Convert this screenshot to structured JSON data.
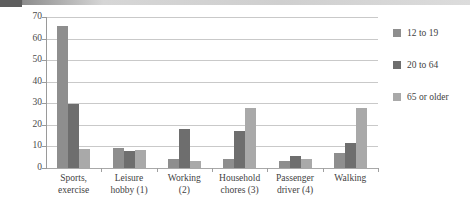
{
  "chart_data": {
    "type": "bar",
    "title": "",
    "subtitle": "",
    "xlabel": "",
    "ylabel": "",
    "ylim": [
      0,
      70
    ],
    "yticks": [
      0,
      10,
      20,
      30,
      40,
      50,
      60,
      70
    ],
    "ytick_labels": [
      "0",
      "10",
      "20",
      "30",
      "40",
      "50",
      "60",
      "70"
    ],
    "grid": true,
    "legend_position": "right",
    "orientation": "vertical",
    "grouped": true,
    "categories": [
      "Sports, exercise",
      "Leisure hobby (1)",
      "Working (2)",
      "Household chores (3)",
      "Passenger driver (4)",
      "Walking"
    ],
    "category_lines": [
      [
        "Sports,",
        "exercise"
      ],
      [
        "Leisure",
        "hobby (1)"
      ],
      [
        "Working",
        "(2)"
      ],
      [
        "Household",
        "chores (3)"
      ],
      [
        "Passenger",
        "driver (4)"
      ],
      [
        "Walking",
        ""
      ]
    ],
    "series": [
      {
        "name": "12 to 19",
        "color": "#8e8e8e",
        "values": [
          66,
          9.1,
          4.0,
          4.0,
          3.4,
          7.0
        ]
      },
      {
        "name": "20 to 64",
        "color": "#6e6e6e",
        "values": [
          29.5,
          7.7,
          18.2,
          17.0,
          5.5,
          11.5
        ]
      },
      {
        "name": "65 or older",
        "color": "#a9a9a9",
        "values": [
          9.0,
          8.3,
          3.4,
          28.0,
          4.0,
          28.0
        ]
      }
    ]
  },
  "legend": {
    "entries": [
      {
        "label": "12 to 19",
        "color": "#8e8e8e"
      },
      {
        "label": "20 to 64",
        "color": "#6e6e6e"
      },
      {
        "label": "65 or older",
        "color": "#a9a9a9"
      }
    ]
  }
}
